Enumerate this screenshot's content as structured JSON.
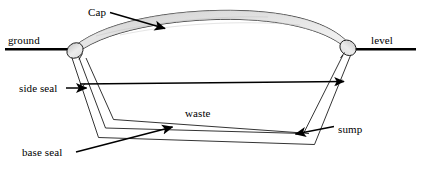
{
  "figure": {
    "kind": "cross-section-diagram",
    "background_color": "#ffffff",
    "line_color": "#000000",
    "cap_fill_light": "#f2f2f2",
    "cap_fill_mid": "#d9d9d9",
    "cap_fill_dark": "#cccccc"
  },
  "labels": {
    "cap": "Cap",
    "ground": "ground",
    "level": "level",
    "side_seal": "side seal",
    "waste": "waste",
    "sump": "sump",
    "base_seal": "base seal"
  },
  "icons": {
    "cap_leader_arrow": "arrow-down-right-icon",
    "side_seal_arrow": "arrow-right-icon",
    "span_arrow": "arrow-right-icon",
    "sump_arrow": "arrow-left-icon",
    "base_seal_arrow": "arrow-up-right-icon"
  }
}
